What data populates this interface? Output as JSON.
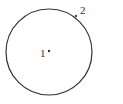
{
  "diagram": {
    "type": "circle-with-points",
    "circle": {
      "cx": 49,
      "cy": 52,
      "r": 43,
      "stroke": "#333333"
    },
    "points": [
      {
        "label": "1",
        "x": 49,
        "y": 52,
        "label_x": 40,
        "label_y": 57,
        "position": "near center"
      },
      {
        "label": "2",
        "x": 76,
        "y": 16,
        "label_x": 80,
        "label_y": 14,
        "position": "on circle"
      }
    ]
  }
}
